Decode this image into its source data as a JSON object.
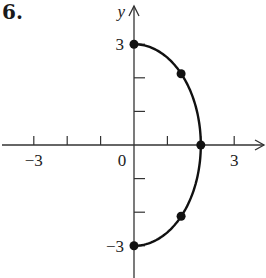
{
  "problem": {
    "number": "6."
  },
  "chart_data": {
    "type": "line",
    "title": "",
    "xlabel": "",
    "ylabel": "y",
    "xlim": [
      -3.9,
      3.9
    ],
    "ylim": [
      -3.9,
      4.1
    ],
    "x_ticks": [
      -3,
      -2,
      -1,
      1,
      2,
      3
    ],
    "y_ticks": [
      -3,
      -2,
      -1,
      1,
      2,
      3
    ],
    "x_tick_labels": [
      {
        "value": -3,
        "label": "−3"
      },
      {
        "value": 0,
        "label": "0"
      },
      {
        "value": 3,
        "label": "3"
      }
    ],
    "y_tick_labels": [
      {
        "value": 3,
        "label": "3"
      },
      {
        "value": -3,
        "label": "−3"
      }
    ],
    "grid": false,
    "series": [
      {
        "name": "right half of ellipse x²/4 + y²/9 = 1",
        "equation": "x = 2·sqrt(1 - y²/9), x ≥ 0",
        "curve": "ellipse-right-half",
        "a": 2,
        "b": 3,
        "points": [
          {
            "x": 0,
            "y": 3
          },
          {
            "x": 1.41,
            "y": 2.12
          },
          {
            "x": 2,
            "y": 0
          },
          {
            "x": 1.41,
            "y": -2.12
          },
          {
            "x": 0,
            "y": -3
          }
        ],
        "color": "#111111"
      }
    ]
  },
  "style": {
    "axis_color": "#333333",
    "curve_color": "#111111",
    "dot_color": "#111111"
  }
}
